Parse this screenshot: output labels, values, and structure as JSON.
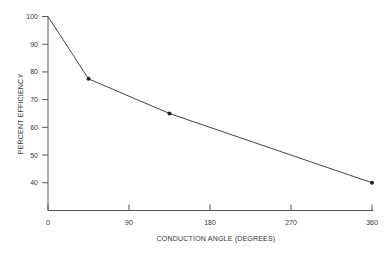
{
  "chart_data": {
    "type": "line",
    "title": "",
    "xlabel": "CONDUCTION ANGLE (DEGREES)",
    "ylabel": "PERCENT EFFICIENCY",
    "x": [
      0,
      45,
      135,
      360
    ],
    "series": [
      {
        "name": "Efficiency",
        "values": [
          100,
          77.5,
          65,
          40
        ],
        "markers": [
          false,
          true,
          true,
          true
        ]
      }
    ],
    "xlim": [
      0,
      360
    ],
    "ylim": [
      30,
      100
    ],
    "xticks": [
      0,
      90,
      180,
      270,
      360
    ],
    "yticks": [
      40,
      50,
      60,
      70,
      80,
      90,
      100
    ],
    "grid": false,
    "legend": null,
    "colors": {
      "line": "#444444",
      "axis": "#555555",
      "marker": "#222222"
    }
  }
}
